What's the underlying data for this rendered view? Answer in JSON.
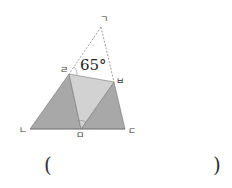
{
  "diagram": {
    "type": "folded-triangle",
    "points": {
      "giyeok": {
        "label": "ㄱ",
        "x": 101,
        "y": 27
      },
      "nieun": {
        "label": "ㄴ",
        "x": 30,
        "y": 129
      },
      "digeut": {
        "label": "ㄷ",
        "x": 125,
        "y": 129
      },
      "rieul": {
        "label": "ㄹ",
        "x": 69,
        "y": 74
      },
      "mieum": {
        "label": "ㅁ",
        "x": 81,
        "y": 129
      },
      "bieup": {
        "label": "ㅂ",
        "x": 114,
        "y": 82
      }
    },
    "angle_label": "65°",
    "colors": {
      "dark_fill": "#a8a8a8",
      "light_fill": "#d2d2d2",
      "line": "#777777",
      "dashed": "#888888"
    }
  },
  "answer": {
    "open_paren": "(",
    "close_paren": ")",
    "value": ""
  }
}
